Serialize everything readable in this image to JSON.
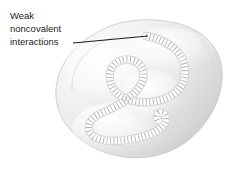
{
  "figure": {
    "background_color": "#ffffff",
    "width": 235,
    "height": 170
  },
  "annotation": {
    "label_lines": [
      "Weak",
      "noncovalent",
      "interactions"
    ],
    "label_line_1": "Weak",
    "label_line_2": "noncovalent",
    "label_line_3": "interactions",
    "text_color": "#1d1d1d",
    "leader_line_color": "#000000",
    "leader_line_start": {
      "x": 73,
      "y": 43
    },
    "leader_line_end": {
      "x": 148,
      "y": 36
    }
  },
  "blob": {
    "fill_light": "#fbfbfb",
    "fill_mid": "#ededed",
    "fill_shadow": "#d6d6d6",
    "outline_color": "#c9c9c9",
    "groove_color": "#ffffff",
    "groove_edge_color": "#d2d2d2"
  },
  "interaction_marks": {
    "name": "noncovalent-interaction-hash-marks",
    "color": "#b4b4b4",
    "description": "faint gray hash marks crossing the white groove",
    "count": 44
  }
}
